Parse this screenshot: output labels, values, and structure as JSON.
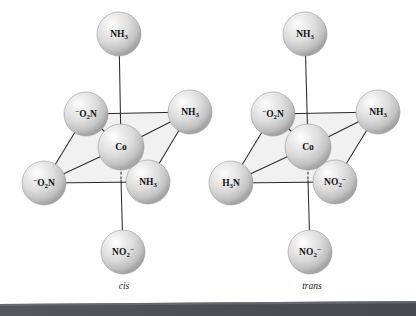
{
  "figure": {
    "background_color": "#ffffff",
    "sphere_color": "#d9d9d9",
    "sphere_edge_color": "#9a9a9a",
    "bond_color": "#2b2b2b",
    "plane_color": "#f1f1f1",
    "bottom_bar_color": "#4f5257"
  },
  "structures": [
    {
      "id": "cis",
      "caption": "cis",
      "caption_pos": {
        "x": 124,
        "y": 289
      },
      "center": {
        "label_formula": "Co",
        "x": 121,
        "y": 147,
        "r": 23
      },
      "ligands": [
        {
          "name": "axial-top",
          "formula": "NH3",
          "charge": "",
          "order": "NH-3",
          "x": 119,
          "y": 34,
          "r": 22,
          "bond": "solid"
        },
        {
          "name": "axial-bottom",
          "formula": "NO2",
          "charge": "-",
          "order": "NO-2-",
          "x": 123,
          "y": 252,
          "r": 22,
          "bond": "solid"
        },
        {
          "name": "equatorial-back-left",
          "formula": "O2N",
          "charge": "-",
          "order": "-O-2N",
          "x": 86,
          "y": 114,
          "r": 22,
          "bond": "solid"
        },
        {
          "name": "equatorial-back-right",
          "formula": "NH3",
          "charge": "",
          "order": "NH-3",
          "x": 190,
          "y": 112,
          "r": 22,
          "bond": "solid"
        },
        {
          "name": "equatorial-front-left",
          "formula": "O2N",
          "charge": "-",
          "order": "-O-2N",
          "x": 44,
          "y": 183,
          "r": 22,
          "bond": "solid"
        },
        {
          "name": "equatorial-front-right",
          "formula": "NH3",
          "charge": "",
          "order": "NH-3",
          "x": 148,
          "y": 182,
          "r": 22,
          "bond": "solid"
        }
      ]
    },
    {
      "id": "trans",
      "caption": "trans",
      "caption_pos": {
        "x": 312,
        "y": 289
      },
      "center": {
        "label_formula": "Co",
        "x": 308,
        "y": 147,
        "r": 23
      },
      "ligands": [
        {
          "name": "axial-top",
          "formula": "NH3",
          "charge": "",
          "order": "NH-3",
          "x": 305,
          "y": 34,
          "r": 22,
          "bond": "solid"
        },
        {
          "name": "axial-bottom",
          "formula": "NO2",
          "charge": "-",
          "order": "NO-2-",
          "x": 310,
          "y": 252,
          "r": 22,
          "bond": "solid"
        },
        {
          "name": "equatorial-back-left",
          "formula": "O2N",
          "charge": "-",
          "order": "-O-2N",
          "x": 273,
          "y": 114,
          "r": 22,
          "bond": "solid"
        },
        {
          "name": "equatorial-back-right",
          "formula": "NH3",
          "charge": "",
          "order": "NH-3",
          "x": 378,
          "y": 112,
          "r": 22,
          "bond": "solid"
        },
        {
          "name": "equatorial-front-left",
          "formula": "H3N",
          "charge": "",
          "order": "H-3N",
          "x": 231,
          "y": 183,
          "r": 22,
          "bond": "solid"
        },
        {
          "name": "equatorial-front-right",
          "formula": "NO2",
          "charge": "-",
          "order": "NO-2-",
          "x": 335,
          "y": 182,
          "r": 22,
          "bond": "solid"
        }
      ]
    }
  ]
}
